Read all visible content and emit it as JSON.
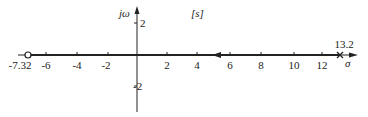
{
  "diagram": {
    "type": "root-locus",
    "plane_label": "[s]",
    "imag_axis_label": "jω",
    "real_axis_label": "σ",
    "colors": {
      "stroke": "#222222",
      "background": "#ffffff"
    },
    "x_ticks": [
      {
        "value": -6,
        "label": "-6"
      },
      {
        "value": -4,
        "label": "-4"
      },
      {
        "value": -2,
        "label": "-2"
      },
      {
        "value": 2,
        "label": "2"
      },
      {
        "value": 4,
        "label": "4"
      },
      {
        "value": 6,
        "label": "6"
      },
      {
        "value": 8,
        "label": "8"
      },
      {
        "value": 10,
        "label": "10"
      },
      {
        "value": 12,
        "label": "12"
      }
    ],
    "y_ticks": [
      {
        "value": 2,
        "label": "2"
      },
      {
        "value": -2,
        "label": "-2"
      }
    ],
    "zero": {
      "value": -7.32,
      "label": "-7.32",
      "marker": "open-circle"
    },
    "pole": {
      "value": 13.2,
      "label": "13.2",
      "marker": "cross"
    },
    "locus_segment": {
      "from": 13.2,
      "to": -7.32,
      "direction": "leftward"
    }
  }
}
